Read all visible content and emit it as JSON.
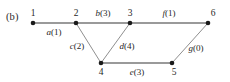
{
  "figure": {
    "panel_label": "(b)",
    "type": "undirected-weighted-graph",
    "colors": {
      "edge_thick": "#9a9a9a",
      "edge_thin": "#8f8f8f",
      "node": "#1a1a1a",
      "text": "#1f1f1f"
    },
    "nodes": [
      {
        "id": "1",
        "label": "1",
        "x": 33,
        "y": 23,
        "label_x": 33,
        "label_y": 9,
        "r": 2.3
      },
      {
        "id": "2",
        "label": "2",
        "x": 76,
        "y": 23,
        "label_x": 76,
        "label_y": 9,
        "r": 2.3
      },
      {
        "id": "3",
        "label": "3",
        "x": 130,
        "y": 23,
        "label_x": 130,
        "label_y": 9,
        "r": 2.3
      },
      {
        "id": "6",
        "label": "6",
        "x": 208,
        "y": 23,
        "label_x": 213,
        "label_y": 9,
        "r": 2.3
      },
      {
        "id": "4",
        "label": "4",
        "x": 101,
        "y": 63,
        "label_x": 101,
        "label_y": 68,
        "r": 2.3
      },
      {
        "id": "5",
        "label": "5",
        "x": 172,
        "y": 63,
        "label_x": 174,
        "label_y": 68,
        "r": 2.3
      }
    ],
    "edges": [
      {
        "id": "a",
        "from": "1",
        "to": "2",
        "letter": "a",
        "weight": "(1)",
        "label": "a(1)",
        "weight_value": 1,
        "style": "thick",
        "label_x": 54,
        "label_y": 28
      },
      {
        "id": "b",
        "from": "2",
        "to": "3",
        "letter": "b",
        "weight": "(3)",
        "label": "b(3)",
        "weight_value": 3,
        "style": "thick",
        "label_x": 103,
        "label_y": 9
      },
      {
        "id": "f",
        "from": "3",
        "to": "6",
        "letter": "f",
        "weight": "(1)",
        "label": "f(1)",
        "weight_value": 1,
        "style": "thick",
        "label_x": 169,
        "label_y": 9
      },
      {
        "id": "c",
        "from": "2",
        "to": "4",
        "letter": "c",
        "weight": "(2)",
        "label": "c(2)",
        "weight_value": 2,
        "style": "thin",
        "label_x": 77,
        "label_y": 42
      },
      {
        "id": "d",
        "from": "3",
        "to": "4",
        "letter": "d",
        "weight": "(4)",
        "label": "d(4)",
        "weight_value": 4,
        "style": "thin",
        "label_x": 127,
        "label_y": 42
      },
      {
        "id": "e",
        "from": "4",
        "to": "5",
        "letter": "e",
        "weight": "(3)",
        "label": "e(3)",
        "weight_value": 3,
        "style": "thick",
        "label_x": 137,
        "label_y": 68
      },
      {
        "id": "g",
        "from": "5",
        "to": "6",
        "letter": "g",
        "weight": "(0)",
        "label": "g(0)",
        "weight_value": 0,
        "style": "thin",
        "label_x": 196,
        "label_y": 44
      }
    ]
  }
}
